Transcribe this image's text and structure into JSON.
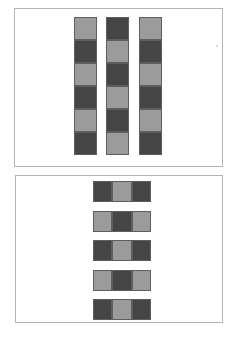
{
  "colors": {
    "dark": "#454545",
    "light": "#9b9b9b",
    "border": "#b4b4b4"
  },
  "panel_top": {
    "orientation": "vertical",
    "columns": [
      {
        "cells": [
          "light",
          "dark",
          "light",
          "dark",
          "light",
          "dark"
        ]
      },
      {
        "cells": [
          "dark",
          "light",
          "dark",
          "light",
          "dark",
          "light"
        ]
      },
      {
        "cells": [
          "light",
          "dark",
          "light",
          "dark",
          "light",
          "dark"
        ]
      }
    ]
  },
  "panel_bottom": {
    "orientation": "horizontal",
    "rows": [
      {
        "cells": [
          "dark",
          "light",
          "dark"
        ]
      },
      {
        "cells": [
          "light",
          "dark",
          "light"
        ]
      },
      {
        "cells": [
          "dark",
          "light",
          "dark"
        ]
      },
      {
        "cells": [
          "light",
          "dark",
          "light"
        ]
      },
      {
        "cells": [
          "dark",
          "light",
          "dark"
        ]
      }
    ]
  }
}
